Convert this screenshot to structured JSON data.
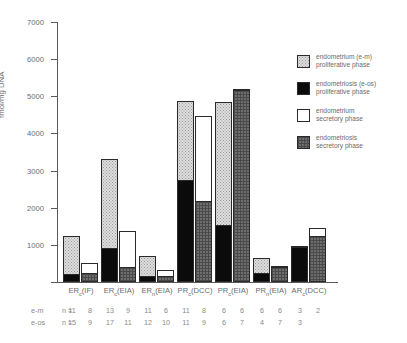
{
  "chart_data": {
    "type": "bar",
    "title": "",
    "xlabel": "",
    "ylabel": "fmol/mg DNA",
    "ylim": [
      0,
      7000
    ],
    "yticks": [
      0,
      1000,
      2000,
      3000,
      4000,
      5000,
      6000,
      7000
    ],
    "ytick_labels": [
      "",
      "1000",
      "2000",
      "3000",
      "4000",
      "5000",
      "6000",
      "7000"
    ],
    "grid": false,
    "legend_position": "right",
    "legend": [
      {
        "key": "em-prolif",
        "label_line1": "endometrium (e-m)",
        "label_line2": "proliferative phase",
        "pattern": "dotted-light"
      },
      {
        "key": "eos-prolif",
        "label_line1": "endometriosis (e-os)",
        "label_line2": "proliferative phase",
        "pattern": "solid-black"
      },
      {
        "key": "em-secret",
        "label_line1": "endometrium",
        "label_line2": "secretory phase",
        "pattern": "white"
      },
      {
        "key": "eos-secret",
        "label_line1": "endometriosis",
        "label_line2": "secretory phase",
        "pattern": "crosshatch-dark"
      }
    ],
    "categories": [
      {
        "base": "ER",
        "sub": "c",
        "assay": "(IF)"
      },
      {
        "base": "ER",
        "sub": "c",
        "assay": "(EIA)"
      },
      {
        "base": "ER",
        "sub": "n",
        "assay": "(EIA)"
      },
      {
        "base": "PR",
        "sub": "c",
        "assay": "(DCC)"
      },
      {
        "base": "PR",
        "sub": "c",
        "assay": "(EIA)"
      },
      {
        "base": "PR",
        "sub": "n",
        "assay": "(EIA)"
      },
      {
        "base": "AR",
        "sub": "c",
        "assay": "(DCC)"
      }
    ],
    "series": [
      {
        "name": "endometrium (e-m)",
        "segment": "proliferative",
        "values": [
          1250,
          3320,
          700,
          4880,
          4860,
          660,
          960
        ]
      },
      {
        "name": "endometriosis (e-os)",
        "segment": "proliferative",
        "values": [
          170,
          880,
          105,
          2720,
          1490,
          215,
          1230
        ]
      },
      {
        "name": "endometrium",
        "segment": "secretory",
        "values": [
          500,
          1370,
          330,
          4470,
          5210,
          430,
          1460
        ]
      },
      {
        "name": "endometriosis",
        "segment": "secretory",
        "values": [
          205,
          370,
          120,
          2150,
          6480,
          390,
          1240
        ]
      }
    ],
    "bars": [
      {
        "category": "ERc(IF)",
        "em_total": 1250,
        "em_prolif": 1250,
        "eos_total": 500,
        "eos_prolif": 170,
        "em2_total": 500,
        "eos2_total": 205
      },
      {
        "category": "ERc(EIA)",
        "em_total": 3320,
        "em_prolif": 880,
        "eos_total": 1370,
        "eos_prolif": 370,
        "em2_total": 1370,
        "eos2_total": 370
      }
    ],
    "n_counts": {
      "row_labels": [
        "e-m",
        "e-os"
      ],
      "n_symbol": "n =",
      "e_m": [
        [
          "11",
          "8"
        ],
        [
          "13",
          "9"
        ],
        [
          "11",
          "6"
        ],
        [
          "11",
          "8"
        ],
        [
          "6",
          "6"
        ],
        [
          "6",
          "6"
        ],
        [
          "3",
          "2"
        ]
      ],
      "e_os": [
        [
          "15",
          "9"
        ],
        [
          "17",
          "11"
        ],
        [
          "12",
          "10"
        ],
        [
          "11",
          "9"
        ],
        [
          "6",
          "7"
        ],
        [
          "4",
          "7"
        ],
        [
          "3",
          ""
        ]
      ]
    }
  }
}
